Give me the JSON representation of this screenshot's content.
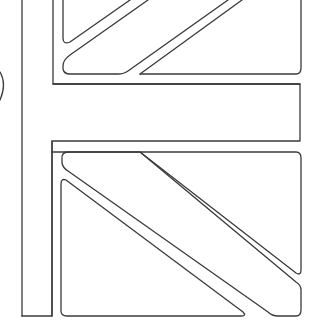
{
  "image": {
    "description": "Black-and-white line-art coloring page fragment of a Union Jack flag",
    "stroke_color": "#3a3a3a",
    "background_color": "#ffffff",
    "width": 314,
    "height": 334
  }
}
